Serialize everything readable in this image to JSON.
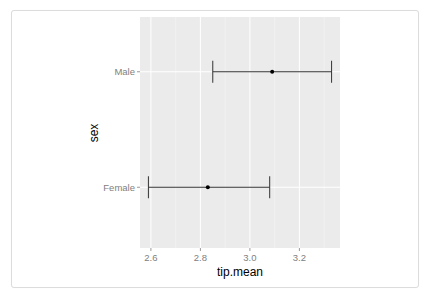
{
  "chart_data": {
    "type": "errorbar",
    "title": "",
    "xlabel": "tip.mean",
    "ylabel": "sex",
    "categories": [
      "Male",
      "Female"
    ],
    "series": [
      {
        "name": "tip.mean",
        "points": [
          {
            "category": "Male",
            "mean": 3.09,
            "lower": 2.85,
            "upper": 3.33
          },
          {
            "category": "Female",
            "mean": 2.83,
            "lower": 2.59,
            "upper": 3.08
          }
        ]
      }
    ],
    "x_ticks": [
      2.6,
      2.8,
      3.0,
      3.2
    ],
    "x_tick_labels": [
      "2.6",
      "2.8",
      "3.0",
      "3.2"
    ],
    "xlim": [
      2.556,
      3.364
    ],
    "grid": true,
    "legend": "none",
    "panel_background": "#ebebeb",
    "grid_color": "#ffffff",
    "bar_color": "#333333"
  }
}
